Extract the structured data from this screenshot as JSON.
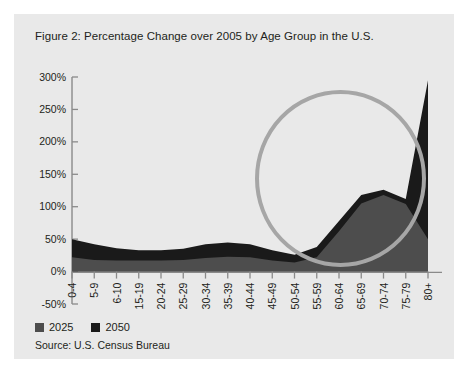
{
  "figure": {
    "title": "Figure 2: Percentage Change over 2005 by Age Group in the U.S.",
    "source": "Source: U.S. Census Bureau",
    "background_color": "#e9e9e9",
    "page_color": "#ffffff"
  },
  "legend": {
    "position": "bottom-left",
    "entries": [
      {
        "label": "2025",
        "color": "#4d4d4d",
        "swatch_name": "legend-swatch-2025"
      },
      {
        "label": "2050",
        "color": "#1a1a1a",
        "swatch_name": "legend-swatch-2050"
      }
    ]
  },
  "annotation": {
    "shape": "ellipse",
    "name": "highlight-circle",
    "color": "#a6a6a6",
    "stroke_width": 4,
    "cx": 340.5,
    "cy": 178.5,
    "rx": 83.5,
    "ry": 86.5
  },
  "axes": {
    "y_label_suffix": "%",
    "y_ticks": [
      300,
      250,
      200,
      150,
      100,
      50,
      0,
      -50
    ],
    "y_tick_labels": [
      "300%",
      "250%",
      "200%",
      "150%",
      "100%",
      "50%",
      "0%",
      "-50%"
    ],
    "ylim": [
      -50,
      300
    ],
    "axis_color": "#808080",
    "x_tick_labels": [
      "0-4",
      "5-9",
      "6-10",
      "15-19",
      "20-24",
      "25-29",
      "30-34",
      "35-39",
      "40-44",
      "45-49",
      "50-54",
      "55-59",
      "60-64",
      "65-69",
      "70-74",
      "75-79",
      "80+"
    ]
  },
  "chart_data": {
    "type": "area",
    "title": "Figure 2: Percentage Change over 2005 by Age Group in the U.S.",
    "xlabel": "",
    "ylabel": "",
    "ylim": [
      -50,
      300
    ],
    "grid": false,
    "legend_position": "bottom-left",
    "categories": [
      "0-4",
      "5-9",
      "6-10",
      "15-19",
      "20-24",
      "25-29",
      "30-34",
      "35-39",
      "40-44",
      "45-49",
      "50-54",
      "55-59",
      "60-64",
      "65-69",
      "70-74",
      "75-79",
      "80+"
    ],
    "series": [
      {
        "name": "2050",
        "color": "#1a1a1a",
        "values": [
          50,
          42,
          36,
          33,
          33,
          35,
          42,
          45,
          42,
          33,
          26,
          38,
          78,
          118,
          126,
          112,
          295
        ]
      },
      {
        "name": "2025",
        "color": "#4d4d4d",
        "values": [
          22,
          18,
          17,
          17,
          17,
          18,
          21,
          23,
          22,
          17,
          14,
          22,
          62,
          105,
          118,
          104,
          50
        ]
      }
    ]
  }
}
